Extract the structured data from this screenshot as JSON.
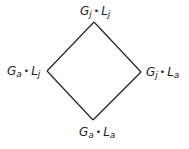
{
  "diagram": {
    "type": "hasse-diamond",
    "line_color": "#222222",
    "nodes": {
      "top": {
        "g": "G",
        "g_sub": "j",
        "sep": "•",
        "l": "L",
        "l_sub": "j",
        "x": 94,
        "y": 22
      },
      "left": {
        "g": "G",
        "g_sub": "a",
        "sep": "•",
        "l": "L",
        "l_sub": "j",
        "x": 47,
        "y": 71
      },
      "right": {
        "g": "G",
        "g_sub": "j",
        "sep": "•",
        "l": "L",
        "l_sub": "a",
        "x": 141,
        "y": 72
      },
      "bottom": {
        "g": "G",
        "g_sub": "a",
        "sep": "•",
        "l": "L",
        "l_sub": "a",
        "x": 93,
        "y": 120
      }
    },
    "edges": [
      [
        "top",
        "left"
      ],
      [
        "top",
        "right"
      ],
      [
        "left",
        "bottom"
      ],
      [
        "right",
        "bottom"
      ]
    ]
  }
}
